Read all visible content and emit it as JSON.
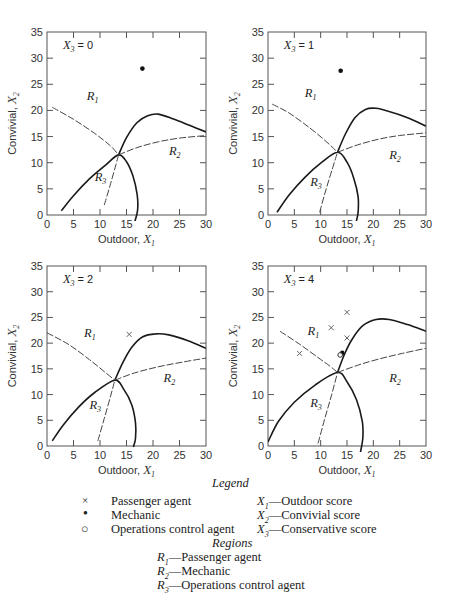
{
  "chart_data": [
    {
      "type": "scatter",
      "title": "X3 = 0",
      "panel_label": {
        "var": "X",
        "sub": "3",
        "value": "= 0"
      },
      "xlabel": "Outdoor, X1",
      "ylabel": "Convivial, X2",
      "xlim": [
        0,
        30
      ],
      "ylim": [
        0,
        35
      ],
      "xticks": [
        0,
        5,
        10,
        15,
        20,
        25,
        30
      ],
      "yticks": [
        0,
        5,
        10,
        15,
        20,
        25,
        30,
        35
      ],
      "grid": false,
      "boundaries": {
        "solid_lower": [
          [
            2.7,
            0.8
          ],
          [
            5,
            3.7
          ],
          [
            8,
            6.9
          ],
          [
            11,
            9.5
          ],
          [
            13.5,
            11.5
          ],
          [
            15,
            10.2
          ],
          [
            16.2,
            7.5
          ],
          [
            17,
            4
          ],
          [
            17.1,
            1
          ],
          [
            16.5,
            -1.5
          ]
        ],
        "solid_upper": [
          [
            13.5,
            11.5
          ],
          [
            15,
            14.8
          ],
          [
            17,
            17.7
          ],
          [
            19,
            19
          ],
          [
            21,
            19.3
          ],
          [
            24,
            18.3
          ],
          [
            27,
            17.1
          ],
          [
            30,
            15.9
          ]
        ],
        "dashed_R1": [
          [
            1,
            20.6
          ],
          [
            5,
            18.3
          ],
          [
            9,
            15.6
          ],
          [
            12,
            13.2
          ],
          [
            13.5,
            11.5
          ]
        ],
        "dashed_R3": [
          [
            10.8,
            1.9
          ],
          [
            12,
            6
          ],
          [
            13,
            9.6
          ],
          [
            13.5,
            11.5
          ]
        ],
        "dashed_R2": [
          [
            13.5,
            11.5
          ],
          [
            17,
            12.9
          ],
          [
            21,
            14
          ],
          [
            25,
            14.7
          ],
          [
            30,
            15.2
          ]
        ]
      },
      "region_labels": [
        {
          "text": "R1",
          "x": 7.5,
          "y": 22
        },
        {
          "text": "R2",
          "x": 23,
          "y": 11.5
        },
        {
          "text": "R3",
          "x": 9,
          "y": 6.5
        }
      ],
      "points": [
        {
          "type": "mechanic",
          "x": 18,
          "y": 28
        }
      ]
    },
    {
      "type": "scatter",
      "title": "X3 = 1",
      "panel_label": {
        "var": "X",
        "sub": "3",
        "value": "= 1"
      },
      "xlabel": "Outdoor, X1",
      "ylabel": "Convivial, X2",
      "xlim": [
        0,
        30
      ],
      "ylim": [
        0,
        35
      ],
      "xticks": [
        0,
        5,
        10,
        15,
        20,
        25,
        30
      ],
      "yticks": [
        0,
        5,
        10,
        15,
        20,
        25,
        30,
        35
      ],
      "grid": false,
      "boundaries": {
        "solid_lower": [
          [
            1.7,
            0.5
          ],
          [
            4,
            3.8
          ],
          [
            7,
            7.2
          ],
          [
            10,
            9.9
          ],
          [
            13.2,
            12
          ],
          [
            15,
            10.1
          ],
          [
            16.3,
            7
          ],
          [
            17.1,
            3.5
          ],
          [
            17.1,
            0.5
          ],
          [
            16.7,
            -1.5
          ]
        ],
        "solid_upper": [
          [
            13.2,
            12
          ],
          [
            14.7,
            15.5
          ],
          [
            16.5,
            18.6
          ],
          [
            18.5,
            20.2
          ],
          [
            20.5,
            20.4
          ],
          [
            23,
            19.8
          ],
          [
            26.5,
            18.6
          ],
          [
            30,
            17
          ]
        ],
        "dashed_R1": [
          [
            0.8,
            21.2
          ],
          [
            4,
            19.5
          ],
          [
            8,
            16.6
          ],
          [
            11,
            14.1
          ],
          [
            13.2,
            12
          ]
        ],
        "dashed_R3": [
          [
            9.8,
            0.5
          ],
          [
            11,
            4.8
          ],
          [
            12.3,
            9.1
          ],
          [
            13.2,
            12
          ]
        ],
        "dashed_R2": [
          [
            13.2,
            12
          ],
          [
            17,
            13.4
          ],
          [
            21,
            14.5
          ],
          [
            25,
            15.2
          ],
          [
            30,
            15.7
          ]
        ]
      },
      "region_labels": [
        {
          "text": "R1",
          "x": 7,
          "y": 22.5
        },
        {
          "text": "R2",
          "x": 23,
          "y": 10.8
        },
        {
          "text": "R3",
          "x": 8,
          "y": 5.5
        }
      ],
      "points": [
        {
          "type": "mechanic",
          "x": 13.8,
          "y": 27.6
        }
      ]
    },
    {
      "type": "scatter",
      "title": "X3 = 2",
      "panel_label": {
        "var": "X",
        "sub": "3",
        "value": "= 2"
      },
      "xlabel": "Outdoor, X1",
      "ylabel": "Convivial, X2",
      "xlim": [
        0,
        30
      ],
      "ylim": [
        0,
        35
      ],
      "xticks": [
        0,
        5,
        10,
        15,
        20,
        25,
        30
      ],
      "yticks": [
        0,
        5,
        10,
        15,
        20,
        25,
        30,
        35
      ],
      "grid": false,
      "boundaries": {
        "solid_lower": [
          [
            1,
            1
          ],
          [
            3,
            4
          ],
          [
            6,
            7.6
          ],
          [
            9,
            10.4
          ],
          [
            12.8,
            12.8
          ],
          [
            14.5,
            11
          ],
          [
            16,
            8
          ],
          [
            16.7,
            4.5
          ],
          [
            16.7,
            1.5
          ],
          [
            16.3,
            -0.2
          ]
        ],
        "solid_upper": [
          [
            12.8,
            12.8
          ],
          [
            14.3,
            16.2
          ],
          [
            16,
            19.2
          ],
          [
            18,
            21.2
          ],
          [
            20.5,
            21.8
          ],
          [
            23,
            21.6
          ],
          [
            26.5,
            20.5
          ],
          [
            30,
            19
          ]
        ],
        "dashed_R1": [
          [
            0,
            22
          ],
          [
            4,
            19.8
          ],
          [
            8,
            16.8
          ],
          [
            11,
            14.3
          ],
          [
            12.8,
            12.8
          ]
        ],
        "dashed_R3": [
          [
            9.6,
            1
          ],
          [
            10.8,
            5.3
          ],
          [
            12,
            9.7
          ],
          [
            12.8,
            12.8
          ]
        ],
        "dashed_R2": [
          [
            12.8,
            12.8
          ],
          [
            16.5,
            14.2
          ],
          [
            21,
            15.4
          ],
          [
            25.5,
            16.3
          ],
          [
            30,
            17.1
          ]
        ]
      },
      "region_labels": [
        {
          "text": "R1",
          "x": 7,
          "y": 21.2
        },
        {
          "text": "R2",
          "x": 22,
          "y": 12.5
        },
        {
          "text": "R3",
          "x": 8,
          "y": 7.2
        }
      ],
      "points": [
        {
          "type": "passenger",
          "x": 15.5,
          "y": 21.7
        }
      ]
    },
    {
      "type": "scatter",
      "title": "X3 = 4",
      "panel_label": {
        "var": "X",
        "sub": "3",
        "value": "= 4"
      },
      "xlabel": "Outdoor, X1",
      "ylabel": "Convivial, X2",
      "xlim": [
        0,
        30
      ],
      "ylim": [
        0,
        35
      ],
      "xticks": [
        0,
        5,
        10,
        15,
        20,
        25,
        30
      ],
      "yticks": [
        0,
        5,
        10,
        15,
        20,
        25,
        30,
        35
      ],
      "grid": false,
      "boundaries": {
        "solid_lower": [
          [
            0,
            0.8
          ],
          [
            2,
            4.8
          ],
          [
            5,
            8.5
          ],
          [
            9,
            11.9
          ],
          [
            13.2,
            14.3
          ],
          [
            15,
            12.5
          ],
          [
            16.8,
            9
          ],
          [
            17.9,
            4.8
          ],
          [
            18,
            1.5
          ],
          [
            17.5,
            -1.5
          ]
        ],
        "solid_upper": [
          [
            13.2,
            14.3
          ],
          [
            14.5,
            17.8
          ],
          [
            16,
            20.8
          ],
          [
            18,
            23.4
          ],
          [
            20.5,
            24.6
          ],
          [
            23,
            24.6
          ],
          [
            26.5,
            23.6
          ],
          [
            30,
            22.3
          ]
        ],
        "dashed_R1": [
          [
            2.3,
            22.3
          ],
          [
            6,
            19.8
          ],
          [
            9.5,
            17.2
          ],
          [
            11.8,
            15.5
          ],
          [
            13.2,
            14.3
          ]
        ],
        "dashed_R3": [
          [
            9.5,
            0.5
          ],
          [
            10.8,
            5.4
          ],
          [
            12.1,
            10
          ],
          [
            13.2,
            14.3
          ]
        ],
        "dashed_R2": [
          [
            13.2,
            14.3
          ],
          [
            17,
            15.7
          ],
          [
            21,
            16.9
          ],
          [
            25.5,
            18
          ],
          [
            30,
            19
          ]
        ]
      },
      "region_labels": [
        {
          "text": "R1",
          "x": 7.5,
          "y": 21.6
        },
        {
          "text": "R2",
          "x": 23,
          "y": 12.5
        },
        {
          "text": "R3",
          "x": 8,
          "y": 7.5
        }
      ],
      "points": [
        {
          "type": "passenger",
          "x": 6,
          "y": 18
        },
        {
          "type": "passenger",
          "x": 12,
          "y": 23
        },
        {
          "type": "passenger",
          "x": 15,
          "y": 26
        },
        {
          "type": "passenger",
          "x": 15,
          "y": 21
        },
        {
          "type": "mechanic",
          "x": 14.1,
          "y": 18.1
        },
        {
          "type": "ops",
          "x": 13.7,
          "y": 17.7
        }
      ]
    }
  ],
  "legend": {
    "title": "Legend",
    "symbols": [
      {
        "glyph": "×",
        "label": "Passenger agent"
      },
      {
        "glyph": "●",
        "label": "Mechanic"
      },
      {
        "glyph": "○",
        "label": "Operations control agent"
      }
    ],
    "variables": [
      {
        "var": "X",
        "sub": "1",
        "label": "—Outdoor score"
      },
      {
        "var": "X",
        "sub": "2",
        "label": "—Convivial score"
      },
      {
        "var": "X",
        "sub": "3",
        "label": "—Conservative score"
      }
    ],
    "regions_title": "Regions",
    "regions": [
      {
        "var": "R",
        "sub": "1",
        "label": "—Passenger agent"
      },
      {
        "var": "R",
        "sub": "2",
        "label": "—Mechanic"
      },
      {
        "var": "R",
        "sub": "3",
        "label": "—Operations control agent"
      }
    ]
  },
  "axis_text": {
    "xlabel_word": "Outdoor, ",
    "xlabel_var": "X",
    "xlabel_sub": "1",
    "ylabel_word": "Convivial, ",
    "ylabel_var": "X",
    "ylabel_sub": "2"
  }
}
